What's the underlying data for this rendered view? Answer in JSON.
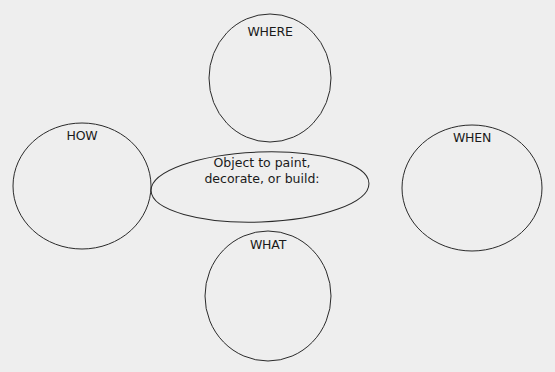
{
  "diagram": {
    "type": "concept-web",
    "center": {
      "line1": "Object to paint,",
      "line2": "decorate, or build:"
    },
    "nodes": {
      "where": {
        "label": "WHERE"
      },
      "how": {
        "label": "HOW"
      },
      "when": {
        "label": "WHEN"
      },
      "what": {
        "label": "WHAT"
      }
    },
    "colors": {
      "stroke": "#2a2a2a",
      "background": "#eeeeee",
      "text": "#1a1a1a"
    }
  }
}
